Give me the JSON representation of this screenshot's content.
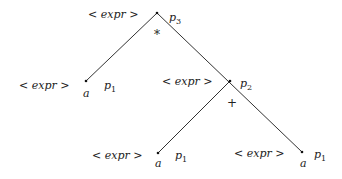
{
  "diagram": {
    "type": "parse-tree",
    "nodes": [
      {
        "id": "root",
        "label": "< expr >",
        "pointer": "p",
        "pointer_sub": "3",
        "operator": "*"
      },
      {
        "id": "left",
        "label": "< expr >",
        "pointer": "p",
        "pointer_sub": "1",
        "leaf": "a"
      },
      {
        "id": "mid",
        "label": "< expr >",
        "pointer": "p",
        "pointer_sub": "2",
        "operator": "+"
      },
      {
        "id": "ll",
        "label": "< expr >",
        "pointer": "p",
        "pointer_sub": "1",
        "leaf": "a"
      },
      {
        "id": "lr",
        "label": "< expr >",
        "pointer": "p",
        "pointer_sub": "1",
        "leaf": "a"
      }
    ],
    "edges": [
      [
        "root",
        "left"
      ],
      [
        "root",
        "mid"
      ],
      [
        "mid",
        "ll"
      ],
      [
        "mid",
        "lr"
      ]
    ]
  }
}
